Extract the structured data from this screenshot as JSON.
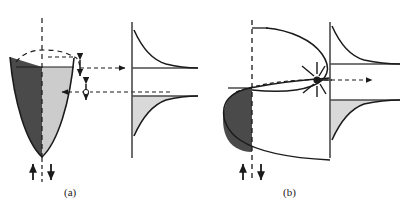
{
  "figure": {
    "kind": "physics-schematic",
    "caption_labels": {
      "panel_a": "(a)",
      "panel_b": "(b)"
    },
    "background_color": "#ffffff",
    "line_color": "#1a1a1a",
    "dark_fill_color": "#4a4a4a",
    "light_fill_color": "#cccccc",
    "medium_fill_color": "#d9d9d9"
  },
  "panels": [
    {
      "id": "a",
      "label": "(a)",
      "left_plot": {
        "name": "parabolic-quantum-well",
        "shape": "parabola-opening-up",
        "axis": "dashed-vertical-center",
        "fill_left": "#4a4a4a",
        "fill_right": "#cccccc",
        "fermi_level_line": "dashed-horizontal",
        "spin_arrows": [
          "up",
          "down"
        ]
      },
      "right_plot": {
        "name": "density-of-states",
        "type": "two-one-over-sqrt-E-branches",
        "upper_branch_fill": "none",
        "lower_branch_fill": "#d9d9d9",
        "vertical_axis": "solid"
      },
      "connectors": [
        {
          "name": "upper-transfer-arrow",
          "direction": "right",
          "style": "dashed"
        },
        {
          "name": "lower-transfer-arrow",
          "direction": "left",
          "style": "dashed"
        },
        {
          "name": "upper-spin-arrow",
          "direction": "double-vertical"
        },
        {
          "name": "lower-spin-arrow",
          "direction": "double-vertical"
        }
      ]
    },
    {
      "id": "b",
      "label": "(b)",
      "left_plot": {
        "name": "spin-split-subbands",
        "shape": "two-parabolas-opening-right",
        "axis": "dashed-vertical",
        "occupied_fill": "#4a4a4a",
        "spin_arrows": [
          "up",
          "down"
        ]
      },
      "right_plot": {
        "name": "density-of-states",
        "type": "two-one-over-sqrt-E-branches",
        "upper_branch_fill": "none",
        "lower_branch_fill": "#d9d9d9",
        "vertical_axis": "solid"
      },
      "connectors": [
        {
          "name": "scattering-burst-icon",
          "style": "starburst"
        },
        {
          "name": "transfer-arrow",
          "direction": "right",
          "style": "dashed"
        }
      ]
    }
  ]
}
